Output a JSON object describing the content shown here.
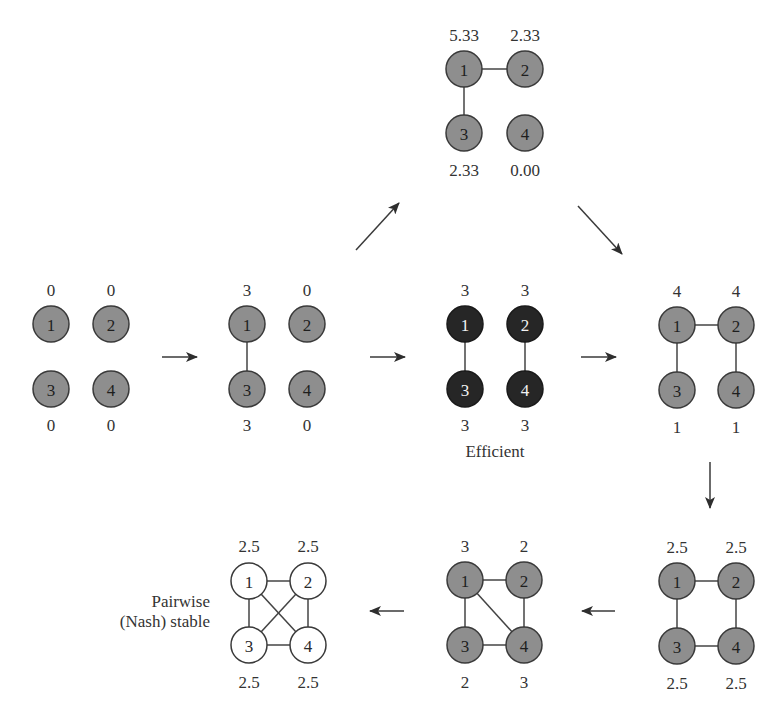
{
  "colors": {
    "node_gray_fill": "#8e8e8e",
    "node_black_fill": "#262626",
    "node_white_fill": "#ffffff",
    "node_stroke": "#3a3a3a",
    "edge": "#444444",
    "arrow": "#333333"
  },
  "graphs": [
    {
      "id": "A",
      "style": "gray",
      "payoffs": {
        "1": "0",
        "2": "0",
        "3": "0",
        "4": "0"
      },
      "edges": []
    },
    {
      "id": "B",
      "style": "gray",
      "payoffs": {
        "1": "3",
        "2": "0",
        "3": "3",
        "4": "0"
      },
      "edges": [
        [
          "1",
          "3"
        ]
      ]
    },
    {
      "id": "C",
      "style": "black",
      "caption": "Efficient",
      "payoffs": {
        "1": "3",
        "2": "3",
        "3": "3",
        "4": "3"
      },
      "edges": [
        [
          "1",
          "3"
        ],
        [
          "2",
          "4"
        ]
      ]
    },
    {
      "id": "D",
      "style": "gray",
      "payoffs": {
        "1": "5.33",
        "2": "2.33",
        "3": "2.33",
        "4": "0.00"
      },
      "edges": [
        [
          "1",
          "2"
        ],
        [
          "1",
          "3"
        ]
      ]
    },
    {
      "id": "E",
      "style": "gray",
      "payoffs": {
        "1": "4",
        "2": "4",
        "3": "1",
        "4": "1"
      },
      "edges": [
        [
          "1",
          "2"
        ],
        [
          "1",
          "3"
        ],
        [
          "2",
          "4"
        ]
      ]
    },
    {
      "id": "F",
      "style": "gray",
      "payoffs": {
        "1": "2.5",
        "2": "2.5",
        "3": "2.5",
        "4": "2.5"
      },
      "edges": [
        [
          "1",
          "2"
        ],
        [
          "1",
          "3"
        ],
        [
          "2",
          "4"
        ],
        [
          "3",
          "4"
        ]
      ]
    },
    {
      "id": "G",
      "style": "gray",
      "payoffs": {
        "1": "3",
        "2": "2",
        "3": "2",
        "4": "3"
      },
      "edges": [
        [
          "1",
          "2"
        ],
        [
          "1",
          "3"
        ],
        [
          "2",
          "4"
        ],
        [
          "3",
          "4"
        ],
        [
          "1",
          "4"
        ]
      ]
    },
    {
      "id": "H",
      "style": "white",
      "caption_lines": [
        "Pairwise",
        "(Nash) stable"
      ],
      "payoffs": {
        "1": "2.5",
        "2": "2.5",
        "3": "2.5",
        "4": "2.5"
      },
      "edges": [
        [
          "1",
          "2"
        ],
        [
          "1",
          "3"
        ],
        [
          "2",
          "4"
        ],
        [
          "3",
          "4"
        ],
        [
          "1",
          "4"
        ],
        [
          "2",
          "3"
        ]
      ]
    }
  ],
  "node_ids": {
    "n1": "1",
    "n2": "2",
    "n3": "3",
    "n4": "4"
  },
  "arrows": [
    {
      "from": "A",
      "to": "B",
      "direction": "right"
    },
    {
      "from": "B",
      "to": "C",
      "direction": "right"
    },
    {
      "from": "B",
      "to": "D",
      "direction": "up-right"
    },
    {
      "from": "C",
      "to": "E",
      "direction": "right"
    },
    {
      "from": "D",
      "to": "E",
      "direction": "down-right"
    },
    {
      "from": "E",
      "to": "F",
      "direction": "down"
    },
    {
      "from": "F",
      "to": "G",
      "direction": "left"
    },
    {
      "from": "G",
      "to": "H",
      "direction": "left"
    }
  ]
}
